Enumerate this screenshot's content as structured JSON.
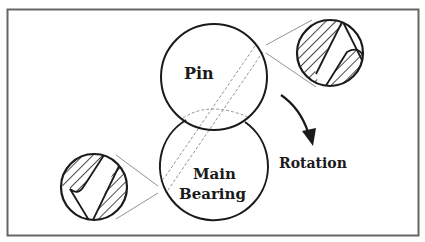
{
  "diagram": {
    "labels": {
      "pin": "Pin",
      "main_line1": "Main",
      "main_line2": "Bearing",
      "rotation": "Rotation"
    },
    "colors": {
      "stroke": "#1a1a1a",
      "frame": "#666666",
      "thin": "#777777",
      "background": "#ffffff"
    }
  }
}
